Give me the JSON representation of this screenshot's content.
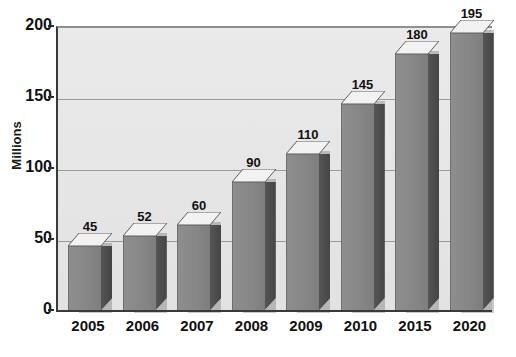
{
  "chart_data": {
    "type": "bar",
    "title": "",
    "subtitle": "",
    "xlabel": "",
    "ylabel": "Millions",
    "categories": [
      "2005",
      "2006",
      "2007",
      "2008",
      "2009",
      "2010",
      "2015",
      "2020"
    ],
    "values": [
      45,
      52,
      60,
      90,
      110,
      145,
      180,
      195
    ],
    "value_labels": [
      "45",
      "52",
      "60",
      "90",
      "110",
      "145",
      "180",
      "195"
    ],
    "ylim": [
      0,
      200
    ],
    "yticks": [
      0,
      50,
      100,
      150,
      200
    ],
    "ytick_labels": [
      "0",
      "50",
      "100",
      "150",
      "200"
    ],
    "grid": true,
    "legend": false,
    "legend_position": "none",
    "style": "3d-columns-grayscale",
    "colors": {
      "bar_front": "#878787",
      "bar_side": "#4b4b4b",
      "bar_top": "#f2f2f2",
      "bar_shadow": "#9e9e9e",
      "plot_background": "#e6e6e6",
      "page_background": "#ffffff",
      "gridline": "#9a9a9a",
      "axis": "#3a3a3a",
      "text": "#111111"
    }
  }
}
